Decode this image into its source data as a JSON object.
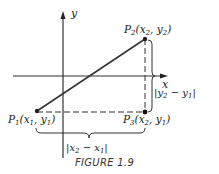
{
  "figure": {
    "caption": "FIGURE 1.9",
    "axes": {
      "x_label": "x",
      "y_label": "y"
    },
    "points": [
      {
        "id": "P1",
        "name": "P",
        "sub": "1",
        "coords_html_a": "x",
        "coords_sub_a": "1",
        "coords_html_b": "y",
        "coords_sub_b": "1",
        "pos": [
          37,
          111
        ]
      },
      {
        "id": "P2",
        "name": "P",
        "sub": "2",
        "coords_html_a": "x",
        "coords_sub_a": "2",
        "coords_html_b": "y",
        "coords_sub_b": "2",
        "pos": [
          145,
          39
        ]
      },
      {
        "id": "P3",
        "name": "P",
        "sub": "3",
        "coords_html_a": "x",
        "coords_sub_a": "2",
        "coords_html_b": "y",
        "coords_sub_b": "1",
        "pos": [
          145,
          112
        ]
      }
    ],
    "labels": {
      "vertical_distance": {
        "a": "y",
        "a_sub": "2",
        "b": "y",
        "b_sub": "1"
      },
      "horizontal_distance": {
        "a": "x",
        "a_sub": "2",
        "b": "x",
        "b_sub": "1"
      }
    },
    "colors": {
      "line": "#333333",
      "text": "#1a1a1a"
    }
  }
}
